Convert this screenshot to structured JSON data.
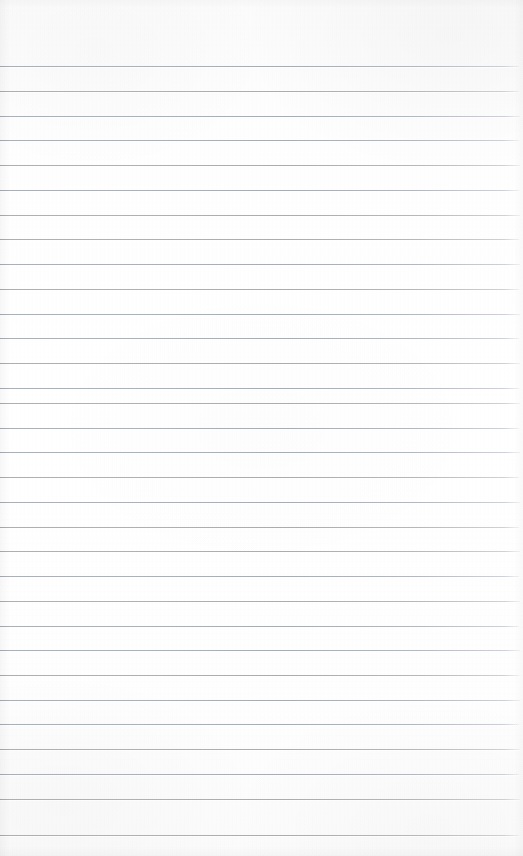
{
  "document": {
    "type": "ruled-notebook-paper",
    "title": "Blank Lined Paper",
    "description": "A blank sheet of ruled notebook paper, scanned. No text, no writing, no margin rule.",
    "orientation": "portrait",
    "width_px": 523,
    "height_px": 856,
    "text_content": "",
    "has_handwriting": false,
    "has_printed_text": false,
    "has_margin_rule": false,
    "has_holes": false
  },
  "colors": {
    "paper_background": "#fdfdfd",
    "paper_background_edge": "#fbfbfc",
    "rule_line": "#a8adb3",
    "rule_line_light": "#bdc1c6",
    "rule_highlight": "#ffffff"
  },
  "ruling": {
    "style": "wide-ruled horizontal lines",
    "line_count": 32,
    "first_line_y": 66,
    "last_line_y": 835,
    "line_spacing_px": 24.8,
    "line_thickness_px": 1,
    "top_margin_px": 66,
    "bottom_margin_px": 21,
    "line_start_x": 0,
    "line_end_x": 519,
    "line_inset_right_px": 4
  },
  "lines": [
    {
      "index": 1,
      "y": 66,
      "width_px": 519
    },
    {
      "index": 2,
      "y": 91,
      "width_px": 519
    },
    {
      "index": 3,
      "y": 116,
      "width_px": 520
    },
    {
      "index": 4,
      "y": 140,
      "width_px": 519
    },
    {
      "index": 5,
      "y": 165,
      "width_px": 520
    },
    {
      "index": 6,
      "y": 190,
      "width_px": 519
    },
    {
      "index": 7,
      "y": 215,
      "width_px": 520
    },
    {
      "index": 8,
      "y": 239,
      "width_px": 519
    },
    {
      "index": 9,
      "y": 264,
      "width_px": 520
    },
    {
      "index": 10,
      "y": 289,
      "width_px": 519
    },
    {
      "index": 11,
      "y": 314,
      "width_px": 520
    },
    {
      "index": 12,
      "y": 338,
      "width_px": 519
    },
    {
      "index": 13,
      "y": 363,
      "width_px": 520
    },
    {
      "index": 14,
      "y": 388,
      "width_px": 519
    },
    {
      "index": 15,
      "y": 403,
      "width_px": 520
    },
    {
      "index": 16,
      "y": 428,
      "width_px": 519
    },
    {
      "index": 17,
      "y": 452,
      "width_px": 520
    },
    {
      "index": 18,
      "y": 477,
      "width_px": 519
    },
    {
      "index": 19,
      "y": 502,
      "width_px": 520
    },
    {
      "index": 20,
      "y": 527,
      "width_px": 519
    },
    {
      "index": 21,
      "y": 551,
      "width_px": 520
    },
    {
      "index": 22,
      "y": 576,
      "width_px": 519
    },
    {
      "index": 23,
      "y": 601,
      "width_px": 520
    },
    {
      "index": 24,
      "y": 626,
      "width_px": 519
    },
    {
      "index": 25,
      "y": 650,
      "width_px": 520
    },
    {
      "index": 26,
      "y": 675,
      "width_px": 519
    },
    {
      "index": 27,
      "y": 700,
      "width_px": 520
    },
    {
      "index": 28,
      "y": 724,
      "width_px": 519
    },
    {
      "index": 29,
      "y": 749,
      "width_px": 520
    },
    {
      "index": 30,
      "y": 774,
      "width_px": 519
    },
    {
      "index": 31,
      "y": 799,
      "width_px": 520
    },
    {
      "index": 32,
      "y": 835,
      "width_px": 519
    }
  ]
}
